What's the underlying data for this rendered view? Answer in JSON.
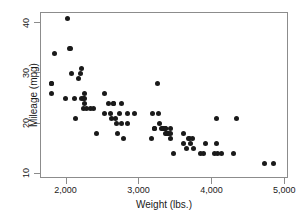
{
  "chart_data": {
    "type": "scatter",
    "title": "",
    "xlabel": "Weight (lbs.)",
    "ylabel": "Mileage (mpg)",
    "xlim": [
      1650,
      5050
    ],
    "ylim": [
      9,
      42
    ],
    "xticks": [
      2000,
      3000,
      4000,
      5000
    ],
    "xtick_labels": [
      "2,000",
      "3,000",
      "4,000",
      "5,000"
    ],
    "yticks": [
      10,
      20,
      30,
      40
    ],
    "ytick_labels": [
      "10",
      "20",
      "30",
      "40"
    ],
    "grid": false,
    "legend": false,
    "marker_color": "#1a1a1a",
    "marker_size": 5,
    "frame_color": "#8c8c8c",
    "background": "#ffffff",
    "x": [
      1800,
      1800,
      1800,
      1830,
      1980,
      2020,
      2040,
      2050,
      2070,
      2110,
      2120,
      2160,
      2190,
      2200,
      2200,
      2230,
      2230,
      2240,
      2240,
      2250,
      2280,
      2330,
      2370,
      2410,
      2520,
      2520,
      2580,
      2600,
      2610,
      2640,
      2650,
      2670,
      2690,
      2700,
      2730,
      2750,
      2750,
      2780,
      2830,
      2840,
      2930,
      3170,
      3180,
      3200,
      3210,
      3250,
      3260,
      3280,
      3300,
      3310,
      3330,
      3350,
      3350,
      3360,
      3370,
      3380,
      3400,
      3420,
      3420,
      3430,
      3470,
      3600,
      3600,
      3640,
      3670,
      3690,
      3700,
      3730,
      3740,
      3830,
      3880,
      3900,
      4030,
      4060,
      4060,
      4070,
      4130,
      4290,
      4330,
      4720,
      4840
    ],
    "y": [
      28,
      28,
      26,
      34,
      25,
      41,
      35,
      35,
      30,
      25,
      21,
      29,
      30,
      31,
      25,
      25,
      23,
      26,
      25,
      24,
      23,
      23,
      23,
      18,
      26,
      22,
      24,
      22,
      21,
      24,
      24,
      21,
      20,
      18,
      22,
      24,
      20,
      17,
      22,
      20,
      22,
      17,
      22,
      19,
      19,
      28,
      22,
      20,
      19,
      19,
      19,
      19,
      18,
      19,
      18,
      18,
      18,
      19,
      17,
      18,
      14,
      16,
      18,
      15,
      17,
      17,
      16,
      17,
      15,
      14,
      14,
      16,
      14,
      16,
      21,
      14,
      14,
      14,
      21,
      12,
      12
    ]
  },
  "axis_titles": {
    "x": "Weight (lbs.)",
    "y": "Mileage (mpg)"
  }
}
